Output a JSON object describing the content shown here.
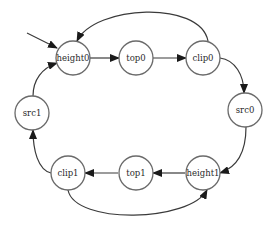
{
  "diagram": {
    "type": "state-cycle",
    "nodes": [
      {
        "id": "height0",
        "label": "height0",
        "x": 73,
        "y": 58
      },
      {
        "id": "top0",
        "label": "top0",
        "x": 136,
        "y": 58
      },
      {
        "id": "clip0",
        "label": "clip0",
        "x": 203,
        "y": 58
      },
      {
        "id": "src0",
        "label": "src0",
        "x": 245,
        "y": 110
      },
      {
        "id": "height1",
        "label": "height1",
        "x": 203,
        "y": 173
      },
      {
        "id": "top1",
        "label": "top1",
        "x": 136,
        "y": 173
      },
      {
        "id": "clip1",
        "label": "clip1",
        "x": 68,
        "y": 173
      },
      {
        "id": "src1",
        "label": "src1",
        "x": 32,
        "y": 113
      }
    ],
    "edges": [
      {
        "from": "start",
        "to": "height0"
      },
      {
        "from": "height0",
        "to": "top0"
      },
      {
        "from": "top0",
        "to": "clip0"
      },
      {
        "from": "clip0",
        "to": "height0"
      },
      {
        "from": "clip0",
        "to": "src0"
      },
      {
        "from": "src0",
        "to": "height1"
      },
      {
        "from": "height1",
        "to": "top1"
      },
      {
        "from": "top1",
        "to": "clip1"
      },
      {
        "from": "clip1",
        "to": "height1"
      },
      {
        "from": "clip1",
        "to": "src1"
      },
      {
        "from": "src1",
        "to": "height0"
      }
    ]
  }
}
